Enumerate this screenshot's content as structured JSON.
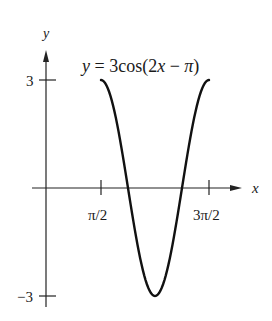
{
  "chart_data": {
    "type": "line",
    "title": "y = 3cos(2x − π)",
    "equation": {
      "prefix_italic": "y",
      "eq": " = 3cos(",
      "var": "2x",
      "rest": " − ",
      "pi": "π",
      "close": ")"
    },
    "xlabel": "x",
    "ylabel": "y",
    "xticks": [
      {
        "value": 1.5708,
        "label": "π/2"
      },
      {
        "value": 4.7124,
        "label": "3π/2"
      }
    ],
    "yticks": [
      {
        "value": 3,
        "label": "3"
      },
      {
        "value": -3,
        "label": "−3"
      }
    ],
    "series": [
      {
        "name": "y = 3cos(2x − π)",
        "x_range": [
          1.5708,
          4.7124
        ],
        "amplitude": 3,
        "period": 3.1416,
        "phase_shift": 1.5708
      }
    ],
    "x": [
      1.5708,
      2.3562,
      3.1416,
      3.927,
      4.7124
    ],
    "values": [
      3,
      0,
      -3,
      0,
      3
    ],
    "ylim": [
      -3,
      3
    ],
    "grid": false,
    "legend": "none"
  }
}
